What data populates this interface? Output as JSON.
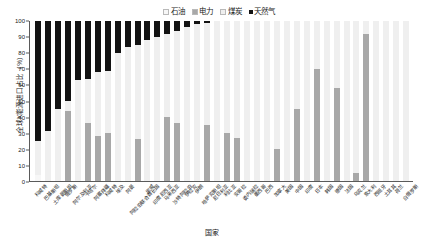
{
  "chart_data": {
    "type": "bar",
    "subtype": "stacked-100",
    "title": "",
    "xlabel": "国家",
    "ylabel": "全球X能源进口占比（%）",
    "ylim": [
      0,
      100
    ],
    "yticks": [
      0,
      10,
      20,
      30,
      40,
      50,
      60,
      70,
      80,
      90,
      100
    ],
    "grid": false,
    "legend_position": "top-center",
    "colors": {
      "oil": "#f7f7f7",
      "electricity": "#a8a8a8",
      "coal": "#efefef",
      "natural_gas": "#131313"
    },
    "series": [
      {
        "name": "石油",
        "key": "oil",
        "values": [
          4,
          0,
          0,
          0,
          0,
          0,
          0,
          0,
          0,
          0,
          0,
          0,
          0,
          0,
          0,
          0,
          0,
          0,
          0,
          0,
          0,
          0,
          0,
          0,
          0,
          0,
          0,
          0,
          0,
          0,
          0,
          0,
          0,
          0,
          0,
          0,
          0,
          0
        ]
      },
      {
        "name": "电力",
        "key": "electricity",
        "values": [
          0,
          0,
          0,
          44,
          0,
          36,
          28,
          30,
          0,
          0,
          26,
          0,
          0,
          40,
          36,
          0,
          0,
          35,
          0,
          30,
          27,
          0,
          0,
          0,
          20,
          0,
          45,
          0,
          70,
          0,
          58,
          0,
          5,
          92,
          0,
          0,
          0,
          0
        ]
      },
      {
        "name": "煤炭",
        "key": "coal",
        "values": [
          0,
          0,
          0,
          0,
          0,
          0,
          0,
          0,
          0,
          0,
          0,
          0,
          0,
          0,
          0,
          0,
          0,
          0,
          0,
          0,
          0,
          0,
          0,
          0,
          0,
          0,
          0,
          0,
          0,
          0,
          0,
          0,
          0,
          0,
          0,
          0,
          0,
          0
        ]
      },
      {
        "name": "天然气",
        "key": "natural_gas",
        "values": [
          75,
          69,
          55,
          50,
          37,
          32,
          32,
          31,
          20,
          16,
          15,
          14,
          10,
          8,
          6,
          4,
          2,
          1.5,
          0,
          0,
          0,
          0,
          0,
          0,
          0,
          0,
          0,
          0,
          0,
          0,
          0,
          0,
          0,
          0,
          0,
          0,
          0,
          0
        ]
      }
    ],
    "stack_order": [
      "oil",
      "electricity",
      "coal",
      "natural_gas"
    ],
    "bar_totals": [
      100,
      100,
      100,
      100,
      100,
      100,
      100,
      100,
      100,
      100,
      100,
      100,
      100,
      100,
      100,
      100,
      100,
      100,
      100,
      100,
      100,
      100,
      100,
      100,
      100,
      100,
      100,
      100,
      100,
      100,
      100,
      100,
      100,
      100,
      100,
      100,
      100,
      100
    ],
    "bars": [
      {
        "category": "科威特",
        "natural_gas_top": 100,
        "natural_gas_bottom": 25,
        "electricity_top": 0,
        "electricity_bottom": 0,
        "oil_top": 4,
        "oil_bottom": 0
      },
      {
        "category": "巴基斯坦",
        "natural_gas_top": 100,
        "natural_gas_bottom": 31,
        "electricity_top": 0,
        "electricity_bottom": 0,
        "oil_top": 0,
        "oil_bottom": 0
      },
      {
        "category": "土库曼斯坦",
        "natural_gas_top": 100,
        "natural_gas_bottom": 45,
        "electricity_top": 0,
        "electricity_bottom": 0,
        "oil_top": 0,
        "oil_bottom": 0
      },
      {
        "category": "俄罗斯",
        "natural_gas_top": 100,
        "natural_gas_bottom": 50,
        "electricity_top": 44,
        "electricity_bottom": 0,
        "oil_top": 0,
        "oil_bottom": 0
      },
      {
        "category": "阿尔及利亚",
        "natural_gas_top": 100,
        "natural_gas_bottom": 63,
        "electricity_top": 0,
        "electricity_bottom": 0,
        "oil_top": 0,
        "oil_bottom": 0
      },
      {
        "category": "卡塔尔",
        "natural_gas_top": 100,
        "natural_gas_bottom": 64,
        "electricity_top": 36,
        "electricity_bottom": 0,
        "oil_top": 0,
        "oil_bottom": 0
      },
      {
        "category": "阿塞拜疆",
        "natural_gas_top": 100,
        "natural_gas_bottom": 68,
        "electricity_top": 28,
        "electricity_bottom": 0,
        "oil_top": 0,
        "oil_bottom": 0
      },
      {
        "category": "科威特",
        "natural_gas_top": 100,
        "natural_gas_bottom": 69,
        "electricity_top": 30,
        "electricity_bottom": 0,
        "oil_top": 0,
        "oil_bottom": 0
      },
      {
        "category": "埃及",
        "natural_gas_top": 100,
        "natural_gas_bottom": 80,
        "electricity_top": 0,
        "electricity_bottom": 0,
        "oil_top": 0,
        "oil_bottom": 0
      },
      {
        "category": "阿曼",
        "natural_gas_top": 100,
        "natural_gas_bottom": 84,
        "electricity_top": 0,
        "electricity_bottom": 0,
        "oil_top": 0,
        "oil_bottom": 0
      },
      {
        "category": "阿拉伯联合酋长国",
        "natural_gas_top": 100,
        "natural_gas_bottom": 85,
        "electricity_top": 26,
        "electricity_bottom": 0,
        "oil_top": 0,
        "oil_bottom": 0
      },
      {
        "category": "挪威",
        "natural_gas_top": 100,
        "natural_gas_bottom": 88,
        "electricity_top": 0,
        "electricity_bottom": 0,
        "oil_top": 0,
        "oil_bottom": 0
      },
      {
        "category": "印度尼西亚",
        "natural_gas_top": 100,
        "natural_gas_bottom": 90,
        "electricity_top": 0,
        "electricity_bottom": 0,
        "oil_top": 0,
        "oil_bottom": 0
      },
      {
        "category": "马来西亚",
        "natural_gas_top": 100,
        "natural_gas_bottom": 92,
        "electricity_top": 40,
        "electricity_bottom": 0,
        "oil_top": 0,
        "oil_bottom": 0
      },
      {
        "category": "沙特阿拉伯",
        "natural_gas_top": 100,
        "natural_gas_bottom": 94,
        "electricity_top": 36,
        "electricity_bottom": 0,
        "oil_top": 0,
        "oil_bottom": 0
      },
      {
        "category": "伊拉克",
        "natural_gas_top": 100,
        "natural_gas_bottom": 96,
        "electricity_top": 0,
        "electricity_bottom": 0,
        "oil_top": 0,
        "oil_bottom": 0
      },
      {
        "category": "伊朗",
        "natural_gas_top": 100,
        "natural_gas_bottom": 98,
        "electricity_top": 0,
        "electricity_bottom": 0,
        "oil_top": 0,
        "oil_bottom": 0
      },
      {
        "category": "哈萨克斯坦",
        "natural_gas_top": 100,
        "natural_gas_bottom": 99,
        "electricity_top": 35,
        "electricity_bottom": 0,
        "oil_top": 0,
        "oil_bottom": 0
      },
      {
        "category": "尼日利亚",
        "natural_gas_top": 0,
        "natural_gas_bottom": 0,
        "electricity_top": 0,
        "electricity_bottom": 0,
        "oil_top": 0,
        "oil_bottom": 0
      },
      {
        "category": "利比亚",
        "natural_gas_top": 0,
        "natural_gas_bottom": 0,
        "electricity_top": 30,
        "electricity_bottom": 0,
        "oil_top": 0,
        "oil_bottom": 0
      },
      {
        "category": "安哥拉",
        "natural_gas_top": 0,
        "natural_gas_bottom": 0,
        "electricity_top": 27,
        "electricity_bottom": 0,
        "oil_top": 0,
        "oil_bottom": 0
      },
      {
        "category": "委内瑞拉",
        "natural_gas_top": 0,
        "natural_gas_bottom": 0,
        "electricity_top": 0,
        "electricity_bottom": 0,
        "oil_top": 0,
        "oil_bottom": 0
      },
      {
        "category": "墨西哥",
        "natural_gas_top": 0,
        "natural_gas_bottom": 0,
        "electricity_top": 0,
        "electricity_bottom": 0,
        "oil_top": 0,
        "oil_bottom": 0
      },
      {
        "category": "巴西",
        "natural_gas_top": 0,
        "natural_gas_bottom": 0,
        "electricity_top": 0,
        "electricity_bottom": 0,
        "oil_top": 0,
        "oil_bottom": 0
      },
      {
        "category": "加拿大",
        "natural_gas_top": 0,
        "natural_gas_bottom": 0,
        "electricity_top": 20,
        "electricity_bottom": 0,
        "oil_top": 0,
        "oil_bottom": 0
      },
      {
        "category": "美国",
        "natural_gas_top": 0,
        "natural_gas_bottom": 0,
        "electricity_top": 0,
        "electricity_bottom": 0,
        "oil_top": 0,
        "oil_bottom": 0
      },
      {
        "category": "中国",
        "natural_gas_top": 0,
        "natural_gas_bottom": 0,
        "electricity_top": 45,
        "electricity_bottom": 0,
        "oil_top": 0,
        "oil_bottom": 0
      },
      {
        "category": "印度",
        "natural_gas_top": 0,
        "natural_gas_bottom": 0,
        "electricity_top": 0,
        "electricity_bottom": 0,
        "oil_top": 0,
        "oil_bottom": 0
      },
      {
        "category": "日本",
        "natural_gas_top": 0,
        "natural_gas_bottom": 0,
        "electricity_top": 70,
        "electricity_bottom": 0,
        "oil_top": 0,
        "oil_bottom": 0
      },
      {
        "category": "韩国",
        "natural_gas_top": 0,
        "natural_gas_bottom": 0,
        "electricity_top": 0,
        "electricity_bottom": 0,
        "oil_top": 0,
        "oil_bottom": 0
      },
      {
        "category": "德国",
        "natural_gas_top": 0,
        "natural_gas_bottom": 0,
        "electricity_top": 58,
        "electricity_bottom": 0,
        "oil_top": 0,
        "oil_bottom": 0
      },
      {
        "category": "法国",
        "natural_gas_top": 0,
        "natural_gas_bottom": 0,
        "electricity_top": 0,
        "electricity_bottom": 0,
        "oil_top": 0,
        "oil_bottom": 0
      },
      {
        "category": "乌克兰",
        "natural_gas_top": 0,
        "natural_gas_bottom": 0,
        "electricity_top": 5,
        "electricity_bottom": 0,
        "oil_top": 0,
        "oil_bottom": 0
      },
      {
        "category": "意大利",
        "natural_gas_top": 0,
        "natural_gas_bottom": 0,
        "electricity_top": 92,
        "electricity_bottom": 0,
        "oil_top": 0,
        "oil_bottom": 0
      },
      {
        "category": "西班牙",
        "natural_gas_top": 0,
        "natural_gas_bottom": 0,
        "electricity_top": 0,
        "electricity_bottom": 0,
        "oil_top": 0,
        "oil_bottom": 0
      },
      {
        "category": "土耳其",
        "natural_gas_top": 0,
        "natural_gas_bottom": 0,
        "electricity_top": 0,
        "electricity_bottom": 0,
        "oil_top": 0,
        "oil_bottom": 0
      },
      {
        "category": "荷兰",
        "natural_gas_top": 0,
        "natural_gas_bottom": 0,
        "electricity_top": 0,
        "electricity_bottom": 0,
        "oil_top": 0,
        "oil_bottom": 0
      },
      {
        "category": "白俄罗斯",
        "natural_gas_top": 0,
        "natural_gas_bottom": 0,
        "electricity_top": 0,
        "electricity_bottom": 0,
        "oil_top": 0,
        "oil_bottom": 0
      }
    ]
  },
  "legend": {
    "items": [
      {
        "label": "石油",
        "color": "#f7f7f7"
      },
      {
        "label": "电力",
        "color": "#a8a8a8"
      },
      {
        "label": "煤炭",
        "color": "#efefef"
      },
      {
        "label": "天然气",
        "color": "#131313"
      }
    ]
  },
  "axes": {
    "y_title": "全球X能源进口占比（%）",
    "x_title": "国家",
    "y_ticks": [
      "100",
      "90",
      "80",
      "70",
      "60",
      "50",
      "40",
      "30",
      "20",
      "10",
      "0"
    ]
  }
}
